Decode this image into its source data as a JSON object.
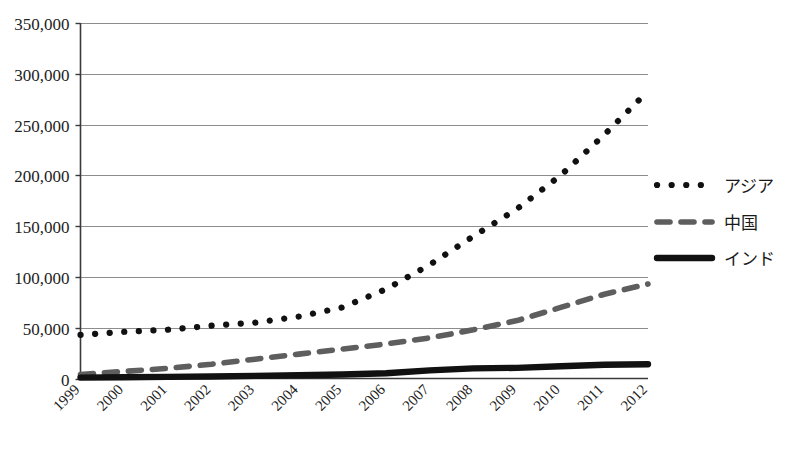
{
  "chart_data": {
    "type": "line",
    "title": "",
    "subtitle": "",
    "xlabel": "",
    "ylabel": "",
    "grid": true,
    "legend_position": "right",
    "categories": [
      "1999",
      "2000",
      "2001",
      "2002",
      "2003",
      "2004",
      "2005",
      "2006",
      "2007",
      "2008",
      "2009",
      "2010",
      "2011",
      "2012"
    ],
    "ylim": [
      0,
      350000
    ],
    "yticks": [
      0,
      50000,
      100000,
      150000,
      200000,
      250000,
      300000,
      350000
    ],
    "ytick_labels": [
      "0",
      "50,000",
      "100,000",
      "150,000",
      "200,000",
      "250,000",
      "300,000",
      "350,000"
    ],
    "series": [
      {
        "name": "アジア",
        "style": "dotted",
        "color": "#111111",
        "values": [
          43000,
          46000,
          48000,
          52000,
          55000,
          61000,
          70000,
          88000,
          112000,
          140000,
          167000,
          200000,
          240000,
          283000
        ]
      },
      {
        "name": "中国",
        "style": "dashed",
        "color": "#5e5e5e",
        "values": [
          4000,
          7000,
          10000,
          14000,
          19000,
          24000,
          29000,
          34000,
          40000,
          48000,
          57000,
          70000,
          83000,
          93000
        ]
      },
      {
        "name": "インド",
        "style": "solid",
        "color": "#111111",
        "values": [
          900,
          1200,
          1600,
          2000,
          2600,
          3200,
          4000,
          5200,
          8000,
          10000,
          10500,
          12000,
          13500,
          14000
        ]
      }
    ]
  },
  "legend": {
    "entries": [
      {
        "label": "アジア",
        "marker": "dotted-line-marker"
      },
      {
        "label": "中国",
        "marker": "dashed-line-marker"
      },
      {
        "label": "インド",
        "marker": "solid-line-marker"
      }
    ]
  }
}
